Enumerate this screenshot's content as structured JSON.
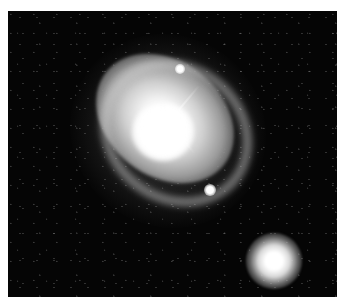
{
  "image": {
    "subject": "spiral galaxy with bright core and companion galaxy",
    "colors": {
      "background": "#ffffff",
      "sky": "#050505",
      "core": "#ffffff"
    },
    "objects": [
      {
        "name": "main-galaxy",
        "center": [
          157,
          122
        ]
      },
      {
        "name": "star-upper",
        "center": [
          180,
          69
        ]
      },
      {
        "name": "star-lower",
        "center": [
          210,
          190
        ]
      },
      {
        "name": "companion-galaxy",
        "center": [
          273,
          258
        ]
      }
    ]
  }
}
